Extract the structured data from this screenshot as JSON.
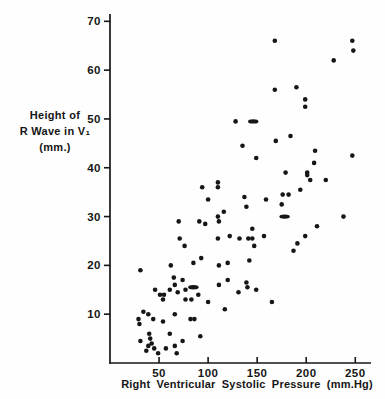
{
  "colors": {
    "ink": "#161616",
    "background": "#fefefe"
  },
  "figure": {
    "y_axis_title_line1": "Height of",
    "y_axis_title_line2": "R Wave in V₁ (mm.)",
    "x_axis_title": "Right Ventricular  Systolic  Pressure (mm.Hg)"
  },
  "chart_data": {
    "type": "scatter",
    "title": "",
    "xlabel": "Right Ventricular Systolic Pressure (mm.Hg)",
    "ylabel": "Height of R Wave in V₁ (mm.)",
    "xlim": [
      0,
      265
    ],
    "ylim": [
      0,
      71.5
    ],
    "x_ticks": [
      50,
      100,
      150,
      200,
      250
    ],
    "y_ticks": [
      10,
      20,
      30,
      40,
      50,
      60,
      70
    ],
    "grid": false,
    "legend": "none",
    "marker": "filled-dot",
    "points": [
      [
        168,
        66
      ],
      [
        247,
        66
      ],
      [
        248,
        64
      ],
      [
        228,
        62
      ],
      [
        168,
        56
      ],
      [
        190,
        56.5
      ],
      [
        199,
        54
      ],
      [
        199,
        52.5
      ],
      [
        128,
        49.5
      ],
      [
        135,
        44.5
      ],
      [
        169,
        45.5
      ],
      [
        184,
        46.5
      ],
      [
        149,
        42
      ],
      [
        209,
        43.5
      ],
      [
        247,
        42.5
      ],
      [
        208,
        41
      ],
      [
        201,
        39
      ],
      [
        201,
        38.5
      ],
      [
        204,
        37.5
      ],
      [
        220,
        37.5
      ],
      [
        194,
        35.5
      ],
      [
        179,
        39
      ],
      [
        110,
        37
      ],
      [
        110,
        36
      ],
      [
        100,
        33.5
      ],
      [
        137,
        34
      ],
      [
        139,
        32
      ],
      [
        159,
        33.5
      ],
      [
        176,
        34.5
      ],
      [
        182,
        34.5
      ],
      [
        175,
        32.5
      ],
      [
        116,
        31
      ],
      [
        110,
        30
      ],
      [
        111,
        29
      ],
      [
        97,
        28.5
      ],
      [
        94,
        36
      ],
      [
        70,
        29
      ],
      [
        91,
        29
      ],
      [
        71,
        25.5
      ],
      [
        76,
        24
      ],
      [
        145,
        27.5
      ],
      [
        122,
        26
      ],
      [
        110,
        25.5
      ],
      [
        132,
        25.5
      ],
      [
        141,
        25.5
      ],
      [
        145,
        25.5
      ],
      [
        157,
        26
      ],
      [
        147,
        24
      ],
      [
        238,
        30
      ],
      [
        211,
        28
      ],
      [
        199,
        26
      ],
      [
        191,
        24.5
      ],
      [
        187,
        23
      ],
      [
        31,
        19
      ],
      [
        62,
        20
      ],
      [
        85,
        20.5
      ],
      [
        93,
        21.5
      ],
      [
        111,
        20
      ],
      [
        120,
        20.5
      ],
      [
        142,
        21
      ],
      [
        65,
        17.5
      ],
      [
        66,
        16
      ],
      [
        74,
        17
      ],
      [
        120,
        17
      ],
      [
        111,
        16
      ],
      [
        139,
        16.5
      ],
      [
        140,
        15.5
      ],
      [
        131,
        14.5
      ],
      [
        149,
        15
      ],
      [
        46,
        15
      ],
      [
        51,
        14
      ],
      [
        55,
        14
      ],
      [
        61,
        15
      ],
      [
        69,
        14.5
      ],
      [
        77,
        15
      ],
      [
        90,
        14
      ],
      [
        77,
        13
      ],
      [
        83,
        13
      ],
      [
        54,
        13
      ],
      [
        100,
        12.5
      ],
      [
        117,
        11
      ],
      [
        165,
        12.5
      ],
      [
        34,
        10.5
      ],
      [
        39,
        10
      ],
      [
        29,
        9
      ],
      [
        44,
        9
      ],
      [
        30,
        8
      ],
      [
        54,
        8.5
      ],
      [
        66,
        10
      ],
      [
        82,
        9
      ],
      [
        86,
        9
      ],
      [
        31,
        4.5
      ],
      [
        40,
        6
      ],
      [
        41,
        5
      ],
      [
        42.5,
        4
      ],
      [
        39,
        3.5
      ],
      [
        45,
        3
      ],
      [
        37,
        2.5
      ],
      [
        61,
        6
      ],
      [
        57,
        3
      ],
      [
        66,
        3.5
      ],
      [
        68,
        2
      ],
      [
        74,
        4.5
      ],
      [
        92,
        5.5
      ],
      [
        49,
        2
      ]
    ],
    "merged_dash_points": [
      [
        146,
        49.5
      ],
      [
        178,
        30
      ],
      [
        85,
        15.5
      ]
    ]
  }
}
